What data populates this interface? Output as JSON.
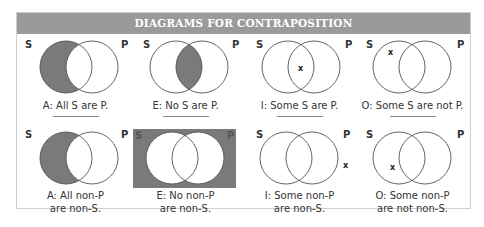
{
  "title": "DIAGRAMS FOR CONTRAPOSITION",
  "colors": {
    "header_bg": "#9a9a9a",
    "shade": "#7a7a7a",
    "circle_stroke": "#555555",
    "frame": "#cfcfcf"
  },
  "rows": [
    {
      "diagrams": [
        {
          "id": "A",
          "left_label": "S",
          "right_label": "P",
          "shading": "S-only",
          "mark": "",
          "caption_line1": "A: All S are P.",
          "caption_line2": ""
        },
        {
          "id": "E",
          "left_label": "S",
          "right_label": "P",
          "shading": "intersection",
          "mark": "",
          "caption_line1": "E: No S are P.",
          "caption_line2": ""
        },
        {
          "id": "I",
          "left_label": "S",
          "right_label": "P",
          "shading": "none",
          "mark": "x",
          "mark_position": "intersection",
          "caption_line1": "I: Some S are P.",
          "caption_line2": ""
        },
        {
          "id": "O",
          "left_label": "S",
          "right_label": "P",
          "shading": "none",
          "mark": "x",
          "mark_position": "S-only",
          "caption_line1": "O: Some S are not P.",
          "caption_line2": ""
        }
      ]
    },
    {
      "diagrams": [
        {
          "id": "A",
          "left_label": "S",
          "right_label": "P",
          "shading": "S-only",
          "mark": "",
          "caption_line1": "A: All non-P",
          "caption_line2": "are non-S."
        },
        {
          "id": "E",
          "left_label": "S",
          "right_label": "P",
          "shading": "outside",
          "mark": "",
          "caption_line1": "E: No non-P",
          "caption_line2": "are non-S."
        },
        {
          "id": "I",
          "left_label": "S",
          "right_label": "P",
          "shading": "none",
          "mark": "x",
          "mark_position": "outside",
          "caption_line1": "I: Some non-P",
          "caption_line2": "are non-S."
        },
        {
          "id": "O",
          "left_label": "S",
          "right_label": "P",
          "shading": "none",
          "mark": "x",
          "mark_position": "S-only",
          "caption_line1": "O: Some non-P",
          "caption_line2": "are not non-S."
        }
      ]
    }
  ]
}
